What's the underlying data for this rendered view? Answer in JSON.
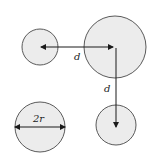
{
  "diagram": {
    "colors": {
      "background": "#ffffff",
      "circle_fill": "#ececec",
      "circle_stroke": "#5a5a5a",
      "arrow": "#1a1a1a",
      "text": "#222222"
    },
    "circles": [
      {
        "name": "small-circle-top-left",
        "cx": 40,
        "cy": 47,
        "r": 18
      },
      {
        "name": "large-circle-top-right",
        "cx": 115,
        "cy": 47,
        "r": 31
      },
      {
        "name": "circle-bottom-left",
        "cx": 40,
        "cy": 127,
        "r": 25
      },
      {
        "name": "circle-bottom-right",
        "cx": 116,
        "cy": 125,
        "r": 20
      }
    ],
    "labels": {
      "horizontal_distance": "d",
      "vertical_distance": "d",
      "diameter": "2r"
    }
  }
}
